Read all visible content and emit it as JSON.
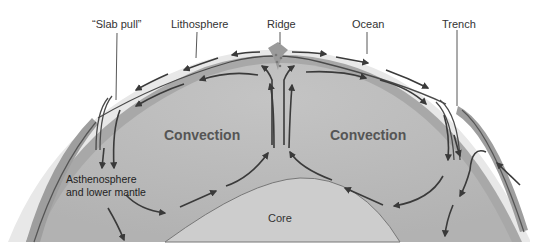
{
  "diagram": {
    "type": "plate-tectonics-mantle-convection",
    "labels": {
      "slab_pull": "“Slab pull”",
      "lithosphere": "Lithosphere",
      "ridge": "Ridge",
      "ocean": "Ocean",
      "trench": "Trench",
      "convection_left": "Convection",
      "convection_right": "Convection",
      "mantle": "Asthenosphere and lower mantle",
      "core": "Core"
    },
    "source_credit": "Source: Bill Ober",
    "colors": {
      "ocean": "#e6e6e6",
      "lithosphere": "#a9a9a9",
      "mantle": "#bdbdbd",
      "core": "#cfcfcf",
      "arrows": "#3a3a3a",
      "leader_lines": "#444444"
    }
  }
}
